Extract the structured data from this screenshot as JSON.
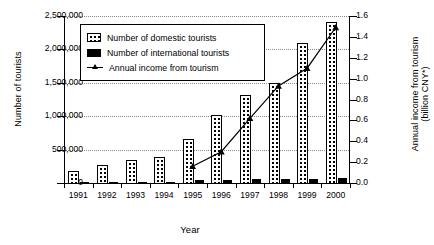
{
  "chart_data": {
    "type": "bar",
    "title": "",
    "xlabel": "Year",
    "ylabel": "Number of tourists",
    "ylabel_right": "Annual income from tourism (billion CNY*)",
    "categories": [
      "1991",
      "1992",
      "1993",
      "1994",
      "1995",
      "1996",
      "1997",
      "1998",
      "1999",
      "2000"
    ],
    "grid": true,
    "legend_position": "upper-left-inside",
    "ylim": [
      0,
      2500000
    ],
    "yticks": [
      "0",
      "500,000",
      "1,000,000",
      "1,500,000",
      "2,000,000",
      "2,500,000"
    ],
    "ylim_right": [
      0,
      1.6
    ],
    "yticks_right": [
      "0.0",
      "0.2",
      "0.4",
      "0.6",
      "0.8",
      "1.0",
      "1.2",
      "1.4",
      "1.6"
    ],
    "series": [
      {
        "name": "Number of domestic tourists",
        "type": "bar",
        "axis": "left",
        "values": [
          190000,
          290000,
          360000,
          400000,
          670000,
          1040000,
          1340000,
          1510000,
          2110000,
          2420000
        ]
      },
      {
        "name": "Number of international tourists",
        "type": "bar",
        "axis": "left",
        "values": [
          12000,
          15000,
          22000,
          30000,
          55000,
          62000,
          70000,
          78000,
          80000,
          95000
        ]
      },
      {
        "name": "Annual income from tourism",
        "type": "line",
        "axis": "right",
        "marker": "triangle",
        "x": [
          "1995",
          "1996",
          "1997",
          "1998",
          "1999",
          "2000"
        ],
        "values": [
          0.16,
          0.3,
          0.62,
          0.93,
          1.1,
          1.49
        ]
      }
    ]
  },
  "legend": {
    "items": [
      {
        "label": "Number of domestic tourists",
        "icon": "dotted-bar-swatch"
      },
      {
        "label": "Number of international tourists",
        "icon": "black-bar-swatch"
      },
      {
        "label": "Annual income from tourism",
        "icon": "triangle-line-swatch"
      }
    ]
  },
  "colors": {
    "axis": "#000000",
    "grid": "#8a8a8a",
    "domestic_bar": "#ffffff",
    "international_bar": "#000000",
    "line": "#000000"
  }
}
